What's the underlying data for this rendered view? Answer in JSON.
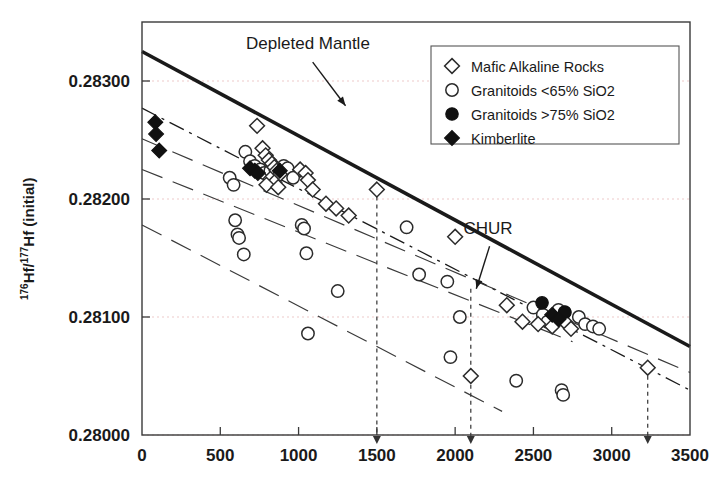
{
  "chart_data": {
    "type": "scatter",
    "title": "",
    "xlabel": "",
    "ylabel": "176Hf/177Hf (initial)",
    "ylabel_parts": {
      "sup1": "176",
      "mid": "Hf/",
      "sup2": "177",
      "tail": "Hf (initial)"
    },
    "xlim": [
      0,
      3500
    ],
    "ylim": [
      0.28,
      0.2835
    ],
    "xticks": [
      0,
      500,
      1000,
      1500,
      2000,
      2500,
      3000,
      3500
    ],
    "xtick_labels": [
      "0",
      "500",
      "1000",
      "1500",
      "2000",
      "2500",
      "3000",
      "3500"
    ],
    "yticks": [
      0.28,
      0.281,
      0.282,
      0.283
    ],
    "ytick_labels": [
      "0.28000",
      "0.28100",
      "0.28200",
      "0.28300"
    ],
    "grid": true,
    "grid_color": "#e8b9b9",
    "legend_position": "top-right",
    "annotations": [
      {
        "name": "depleted-mantle",
        "text": "Depleted Mantle",
        "label_x": 1060,
        "label_y": 0.28327,
        "arrow_from_x": 1090,
        "arrow_from_y": 0.28316,
        "arrow_to_x": 1300,
        "arrow_to_y": 0.28279
      },
      {
        "name": "chur",
        "text": "CHUR",
        "label_x": 2210,
        "label_y": 0.2817,
        "arrow_from_x": 2220,
        "arrow_from_y": 0.2816,
        "arrow_to_x": 2135,
        "arrow_to_y": 0.28124
      }
    ],
    "reference_lines": [
      {
        "name": "depleted-mantle-line",
        "style": "solid-thick",
        "color": "#1a1a1a",
        "width": 3.6,
        "points": [
          [
            0,
            0.28325
          ],
          [
            3500,
            0.28075
          ]
        ]
      },
      {
        "name": "chur-line",
        "style": "dash-dot",
        "color": "#1a1a1a",
        "width": 1.3,
        "points": [
          [
            0,
            0.28277
          ],
          [
            3500,
            0.28038
          ]
        ]
      },
      {
        "name": "evolution-line-1",
        "style": "long-dash",
        "color": "#3a3a3a",
        "width": 1.2,
        "points": [
          [
            0,
            0.28251
          ],
          [
            3500,
            0.28053
          ]
        ]
      },
      {
        "name": "evolution-line-2",
        "style": "long-dash",
        "color": "#3a3a3a",
        "width": 1.2,
        "points": [
          [
            0,
            0.28225
          ],
          [
            2750,
            0.28079
          ]
        ]
      },
      {
        "name": "evolution-line-3",
        "style": "long-dash",
        "color": "#3a3a3a",
        "width": 1.2,
        "points": [
          [
            0,
            0.28178
          ],
          [
            2300,
            0.2802
          ]
        ]
      }
    ],
    "model_age_markers": [
      {
        "name": "model-age-1500",
        "x": 1500,
        "y_top": 0.28209,
        "label": "1500"
      },
      {
        "name": "model-age-2100",
        "x": 2100,
        "y_top": 0.28124,
        "label": "2100"
      },
      {
        "name": "model-age-3230",
        "x": 3230,
        "y_top": 0.28057,
        "label": "3230"
      }
    ],
    "series": [
      {
        "name": "Mafic Alkaline Rocks",
        "marker": "open-diamond",
        "points": [
          [
            735,
            0.28262
          ],
          [
            770,
            0.28243
          ],
          [
            790,
            0.28237
          ],
          [
            810,
            0.28233
          ],
          [
            830,
            0.2823
          ],
          [
            845,
            0.28227
          ],
          [
            860,
            0.28224
          ],
          [
            880,
            0.28221
          ],
          [
            820,
            0.28217
          ],
          [
            845,
            0.28214
          ],
          [
            795,
            0.28212
          ],
          [
            870,
            0.2821
          ],
          [
            1010,
            0.28225
          ],
          [
            1045,
            0.28222
          ],
          [
            1060,
            0.28216
          ],
          [
            1090,
            0.28208
          ],
          [
            1175,
            0.28196
          ],
          [
            1240,
            0.28192
          ],
          [
            1320,
            0.28186
          ],
          [
            1500,
            0.28208
          ],
          [
            2000,
            0.28168
          ],
          [
            2330,
            0.2811
          ],
          [
            2430,
            0.28096
          ],
          [
            2530,
            0.28094
          ],
          [
            2620,
            0.28092
          ],
          [
            2700,
            0.28096
          ],
          [
            2740,
            0.2809
          ],
          [
            2100,
            0.2805
          ],
          [
            3230,
            0.28057
          ]
        ]
      },
      {
        "name": "Granitoids <65% SiO2",
        "marker": "open-circle",
        "points": [
          [
            560,
            0.28218
          ],
          [
            585,
            0.28212
          ],
          [
            595,
            0.28182
          ],
          [
            610,
            0.2817
          ],
          [
            620,
            0.28167
          ],
          [
            650,
            0.28153
          ],
          [
            660,
            0.2824
          ],
          [
            690,
            0.28232
          ],
          [
            720,
            0.28228
          ],
          [
            755,
            0.28225
          ],
          [
            780,
            0.28222
          ],
          [
            820,
            0.28224
          ],
          [
            855,
            0.28221
          ],
          [
            905,
            0.28228
          ],
          [
            930,
            0.28226
          ],
          [
            965,
            0.28218
          ],
          [
            1020,
            0.28178
          ],
          [
            1035,
            0.28175
          ],
          [
            1050,
            0.28154
          ],
          [
            1060,
            0.28086
          ],
          [
            1250,
            0.28122
          ],
          [
            1690,
            0.28176
          ],
          [
            1770,
            0.28136
          ],
          [
            1950,
            0.2813
          ],
          [
            1970,
            0.28066
          ],
          [
            2030,
            0.281
          ],
          [
            2390,
            0.28046
          ],
          [
            2500,
            0.28108
          ],
          [
            2560,
            0.28102
          ],
          [
            2590,
            0.28096
          ],
          [
            2660,
            0.28106
          ],
          [
            2700,
            0.28104
          ],
          [
            2790,
            0.281
          ],
          [
            2830,
            0.28094
          ],
          [
            2680,
            0.28038
          ],
          [
            2690,
            0.28034
          ],
          [
            2880,
            0.28092
          ],
          [
            2920,
            0.2809
          ]
        ]
      },
      {
        "name": "Granitoids >75% SiO2",
        "marker": "filled-circle",
        "points": [
          [
            2555,
            0.28112
          ],
          [
            2700,
            0.28104
          ]
        ]
      },
      {
        "name": "Kimberlite",
        "marker": "filled-diamond",
        "points": [
          [
            85,
            0.28265
          ],
          [
            90,
            0.28255
          ],
          [
            110,
            0.28241
          ],
          [
            690,
            0.28226
          ],
          [
            720,
            0.28224
          ],
          [
            740,
            0.28222
          ],
          [
            880,
            0.28224
          ],
          [
            2620,
            0.28102
          ],
          [
            2660,
            0.28098
          ]
        ]
      }
    ]
  },
  "legend": {
    "items": [
      {
        "marker": "open-diamond",
        "label": "Mafic Alkaline Rocks"
      },
      {
        "marker": "open-circle",
        "label": "Granitoids <65% SiO2"
      },
      {
        "marker": "filled-circle",
        "label": "Granitoids >75% SiO2"
      },
      {
        "marker": "filled-diamond",
        "label": "Kimberlite"
      }
    ]
  }
}
